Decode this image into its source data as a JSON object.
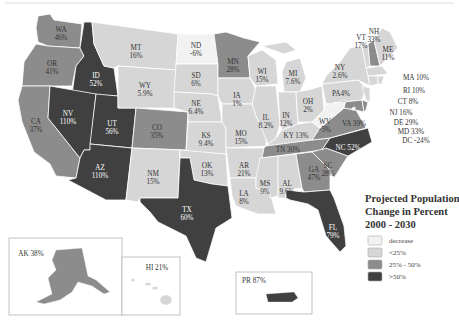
{
  "title_lines": [
    "Projected Population",
    "Change in Percent",
    "2000 - 2030"
  ],
  "legend": [
    {
      "key": "decrease",
      "label": "decrease",
      "color": "#f2f2f2"
    },
    {
      "key": "lt25",
      "label": "<25%",
      "color": "#d6d6d6"
    },
    {
      "key": "25to50",
      "label": "25% - 50%",
      "color": "#8c8c8c"
    },
    {
      "key": "gt50",
      "label": ">50%",
      "color": "#404040"
    }
  ],
  "states": {
    "WA": {
      "label": "WA",
      "value": "46%",
      "cls": "25to50"
    },
    "OR": {
      "label": "OR",
      "value": "41%",
      "cls": "25to50"
    },
    "CA": {
      "label": "CA",
      "value": "37%",
      "cls": "25to50"
    },
    "ID": {
      "label": "ID",
      "value": "52%",
      "cls": "gt50"
    },
    "NV": {
      "label": "NV",
      "value": "110%",
      "cls": "gt50"
    },
    "UT": {
      "label": "UT",
      "value": "56%",
      "cls": "gt50"
    },
    "AZ": {
      "label": "AZ",
      "value": "110%",
      "cls": "gt50"
    },
    "MT": {
      "label": "MT",
      "value": "16%",
      "cls": "lt25"
    },
    "WY": {
      "label": "WY",
      "value": "5.9%",
      "cls": "lt25"
    },
    "CO": {
      "label": "CO",
      "value": "35%",
      "cls": "25to50"
    },
    "NM": {
      "label": "NM",
      "value": "15%",
      "cls": "lt25"
    },
    "ND": {
      "label": "ND",
      "value": "-6%",
      "cls": "decrease"
    },
    "SD": {
      "label": "SD",
      "value": "6%",
      "cls": "lt25"
    },
    "NE": {
      "label": "NE",
      "value": "6.4%",
      "cls": "lt25"
    },
    "KS": {
      "label": "KS",
      "value": "9.4%",
      "cls": "lt25"
    },
    "OK": {
      "label": "OK",
      "value": "13%",
      "cls": "lt25"
    },
    "TX": {
      "label": "TX",
      "value": "60%",
      "cls": "gt50"
    },
    "MN": {
      "label": "MN",
      "value": "28%",
      "cls": "25to50"
    },
    "IA": {
      "label": "IA",
      "value": "1%",
      "cls": "lt25"
    },
    "MO": {
      "label": "MO",
      "value": "15%",
      "cls": "lt25"
    },
    "AR": {
      "label": "AR",
      "value": "21%",
      "cls": "lt25"
    },
    "LA": {
      "label": "LA",
      "value": "8%",
      "cls": "lt25"
    },
    "WI": {
      "label": "WI",
      "value": "15%",
      "cls": "lt25"
    },
    "IL": {
      "label": "IL",
      "value": "8.2%",
      "cls": "lt25"
    },
    "MI": {
      "label": "MI",
      "value": "7.6%",
      "cls": "lt25"
    },
    "IN": {
      "label": "IN",
      "value": "12%",
      "cls": "lt25"
    },
    "OH": {
      "label": "OH",
      "value": "2%",
      "cls": "lt25"
    },
    "KY": {
      "label": "KY",
      "value": "13%",
      "cls": "lt25"
    },
    "TN": {
      "label": "TN",
      "value": "30%",
      "cls": "25to50"
    },
    "MS": {
      "label": "MS",
      "value": "9%",
      "cls": "lt25"
    },
    "AL": {
      "label": "AL",
      "value": "9.6%",
      "cls": "lt25"
    },
    "GA": {
      "label": "GA",
      "value": "47%",
      "cls": "25to50"
    },
    "FL": {
      "label": "FL",
      "value": "79%",
      "cls": "gt50"
    },
    "SC": {
      "label": "SC",
      "value": "28%",
      "cls": "25to50"
    },
    "NC": {
      "label": "NC",
      "value": "52%",
      "cls": "gt50"
    },
    "VA": {
      "label": "VA",
      "value": "39%",
      "cls": "25to50"
    },
    "WV": {
      "label": "WV",
      "value": "-5%",
      "cls": "decrease"
    },
    "PA": {
      "label": "PA",
      "value": "4%",
      "cls": "lt25"
    },
    "NY": {
      "label": "NY",
      "value": "2.6%",
      "cls": "lt25"
    },
    "VT": {
      "label": "VT",
      "value": "17%",
      "cls": "lt25"
    },
    "NH": {
      "label": "NH",
      "value": "33%",
      "cls": "25to50"
    },
    "ME": {
      "label": "ME",
      "value": "11%",
      "cls": "lt25"
    },
    "MA": {
      "label": "MA",
      "value": "10%",
      "cls": "lt25"
    },
    "RI": {
      "label": "RI",
      "value": "10%",
      "cls": "lt25"
    },
    "CT": {
      "label": "CT",
      "value": "8%",
      "cls": "lt25"
    },
    "NJ": {
      "label": "NJ",
      "value": "16%",
      "cls": "lt25"
    },
    "DE": {
      "label": "DE",
      "value": "29%",
      "cls": "25to50"
    },
    "MD": {
      "label": "MD",
      "value": "33%",
      "cls": "25to50"
    },
    "DC": {
      "label": "DC",
      "value": "-24%",
      "cls": "decrease"
    },
    "AK": {
      "label": "AK",
      "value": "38%",
      "cls": "25to50"
    },
    "HI": {
      "label": "HI",
      "value": "21%",
      "cls": "lt25"
    },
    "PR": {
      "label": "PR",
      "value": "87%",
      "cls": "gt50"
    }
  },
  "callouts": {
    "MA": "MA 10%",
    "RI": "RI 10%",
    "CT": "CT 8%",
    "NJ": "NJ 16%",
    "DE": "DE 29%",
    "MD": "MD 33%",
    "DC": "DC -24%",
    "PA": "PA4%",
    "KY": "KY 13%",
    "TN": "TN 30%",
    "VA": "VA 39%",
    "NC": "NC 52%",
    "AK": "AK 38%",
    "HI": "HI 21%",
    "PR": "PR 87%"
  }
}
